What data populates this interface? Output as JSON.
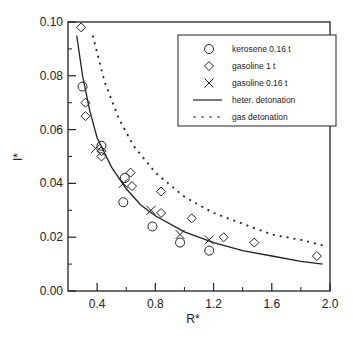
{
  "chart_data": {
    "type": "scatter",
    "title": "",
    "xlabel": "R*",
    "ylabel": "I*",
    "xlim": [
      0.2,
      2.0
    ],
    "ylim": [
      0.0,
      0.1
    ],
    "grid": false,
    "legend_position": "upper right (inside)",
    "x_ticks": [
      0.4,
      0.8,
      1.2,
      1.6,
      2.0
    ],
    "x_minor_ticks": [
      0.6,
      1.0,
      1.4,
      1.8
    ],
    "y_ticks": [
      0.0,
      0.02,
      0.04,
      0.06,
      0.08,
      0.1
    ],
    "y_minor_ticks": [
      0.01,
      0.03,
      0.05,
      0.07,
      0.09
    ],
    "x_tick_labels": [
      "0.4",
      "0.8",
      "1.2",
      "1.6",
      "2.0"
    ],
    "y_tick_labels": [
      "0.00",
      "0.02",
      "0.04",
      "0.06",
      "0.08",
      "0.10"
    ],
    "series": [
      {
        "name": "kerosene 0.16 t",
        "marker": "circle",
        "points": [
          [
            0.3,
            0.076
          ],
          [
            0.43,
            0.054
          ],
          [
            0.59,
            0.042
          ],
          [
            0.58,
            0.033
          ],
          [
            0.78,
            0.024
          ],
          [
            0.97,
            0.018
          ],
          [
            1.17,
            0.015
          ]
        ]
      },
      {
        "name": "gasoline 1 t",
        "marker": "diamond",
        "points": [
          [
            0.29,
            0.098
          ],
          [
            0.32,
            0.07
          ],
          [
            0.32,
            0.065
          ],
          [
            0.43,
            0.052
          ],
          [
            0.43,
            0.05
          ],
          [
            0.63,
            0.044
          ],
          [
            0.64,
            0.039
          ],
          [
            0.84,
            0.037
          ],
          [
            0.84,
            0.029
          ],
          [
            1.05,
            0.027
          ],
          [
            1.27,
            0.02
          ],
          [
            1.48,
            0.018
          ],
          [
            1.91,
            0.013
          ]
        ]
      },
      {
        "name": "gasoline 0.16 t",
        "marker": "x",
        "points": [
          [
            0.39,
            0.053
          ],
          [
            0.58,
            0.04
          ],
          [
            0.77,
            0.03
          ],
          [
            0.97,
            0.021
          ],
          [
            1.17,
            0.019
          ]
        ]
      },
      {
        "name": "heter. detonation",
        "style": "solid-line",
        "points": [
          [
            0.26,
            0.095
          ],
          [
            0.3,
            0.08
          ],
          [
            0.35,
            0.067
          ],
          [
            0.4,
            0.057
          ],
          [
            0.5,
            0.046
          ],
          [
            0.6,
            0.038
          ],
          [
            0.7,
            0.032
          ],
          [
            0.8,
            0.028
          ],
          [
            1.0,
            0.022
          ],
          [
            1.2,
            0.018
          ],
          [
            1.4,
            0.015
          ],
          [
            1.6,
            0.013
          ],
          [
            1.8,
            0.011
          ],
          [
            1.95,
            0.01
          ]
        ]
      },
      {
        "name": "gas detonation",
        "style": "dashed-line",
        "points": [
          [
            0.37,
            0.095
          ],
          [
            0.45,
            0.078
          ],
          [
            0.55,
            0.064
          ],
          [
            0.65,
            0.054
          ],
          [
            0.8,
            0.044
          ],
          [
            1.0,
            0.035
          ],
          [
            1.2,
            0.029
          ],
          [
            1.4,
            0.025
          ],
          [
            1.6,
            0.021
          ],
          [
            1.8,
            0.019
          ],
          [
            1.95,
            0.017
          ]
        ]
      }
    ]
  },
  "legend": {
    "items": [
      {
        "label": "kerosene 0.16 t",
        "symbol": "circle"
      },
      {
        "label": "gasoline 1 t",
        "symbol": "diamond"
      },
      {
        "label": "gasoline 0.16 t",
        "symbol": "x"
      },
      {
        "label": "heter. detonation",
        "symbol": "solid-line"
      },
      {
        "label": "gas detonation",
        "symbol": "dashed-line"
      }
    ]
  },
  "axes": {
    "xlabel": "R*",
    "ylabel": "I*"
  }
}
